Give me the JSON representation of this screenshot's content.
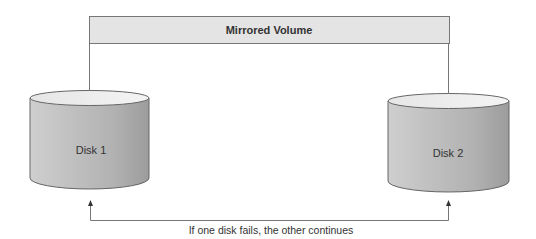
{
  "diagram": {
    "banner": {
      "label": "Mirrored Volume"
    },
    "disks": [
      {
        "label": "Disk 1"
      },
      {
        "label": "Disk 2"
      }
    ],
    "caption": "If one disk fails, the other continues",
    "colors": {
      "banner_fill": "#e4e4e4",
      "line": "#666666",
      "disk_light": "#e2e2e2",
      "disk_dark": "#9a9a9a",
      "disk_top": "#eeeeee"
    }
  }
}
